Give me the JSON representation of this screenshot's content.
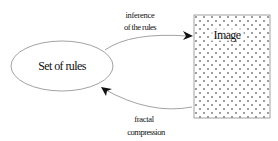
{
  "diagram": {
    "nodes": {
      "rules": {
        "label": "Set of rules",
        "shape": "ellipse"
      },
      "image": {
        "label": "Image",
        "shape": "dotted-rectangle"
      }
    },
    "edges": {
      "top": {
        "from": "rules",
        "to": "image",
        "label_line1": "inference",
        "label_line2": "of the rules"
      },
      "bottom": {
        "from": "image",
        "to": "rules",
        "label_line1": "fractal",
        "label_line2": "compression"
      }
    },
    "colors": {
      "stroke": "#8a8a8a",
      "text": "#111111",
      "dots": "#222222"
    }
  }
}
